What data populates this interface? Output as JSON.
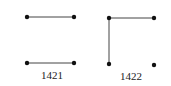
{
  "diagrams": [
    {
      "label": "1421",
      "label_pos": [
        52,
        79
      ],
      "points": [
        [
          27,
          17
        ],
        [
          74,
          17
        ],
        [
          27,
          63
        ],
        [
          74,
          63
        ]
      ],
      "edges": [
        [
          0,
          1
        ],
        [
          2,
          3
        ]
      ]
    },
    {
      "label": "1422",
      "label_pos": [
        131,
        80
      ],
      "points": [
        [
          109,
          18
        ],
        [
          154,
          18
        ],
        [
          109,
          64
        ],
        [
          154,
          65
        ]
      ],
      "edges": [
        [
          0,
          1
        ],
        [
          0,
          2
        ]
      ]
    }
  ],
  "colors": {
    "stroke": "#444444",
    "dot": "#111111"
  }
}
